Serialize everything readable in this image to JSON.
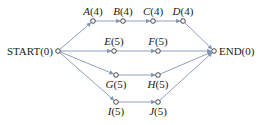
{
  "diagram": {
    "type": "project network (activity-on-node)",
    "nodes": [
      {
        "id": "START",
        "label": "START(0)",
        "letter": "START",
        "duration": "0",
        "x": 58,
        "y": 51
      },
      {
        "id": "A",
        "label": "A(4)",
        "letter": "A",
        "duration": "4",
        "x": 93,
        "y": 21
      },
      {
        "id": "B",
        "label": "B(4)",
        "letter": "B",
        "duration": "4",
        "x": 123,
        "y": 21
      },
      {
        "id": "C",
        "label": "C(4)",
        "letter": "C",
        "duration": "4",
        "x": 153,
        "y": 21
      },
      {
        "id": "D",
        "label": "D(4)",
        "letter": "D",
        "duration": "4",
        "x": 183,
        "y": 21
      },
      {
        "id": "E",
        "label": "E(5)",
        "letter": "E",
        "duration": "5",
        "x": 114,
        "y": 51
      },
      {
        "id": "F",
        "label": "F(5)",
        "letter": "F",
        "duration": "5",
        "x": 158,
        "y": 51
      },
      {
        "id": "G",
        "label": "G(5)",
        "letter": "G",
        "duration": "5",
        "x": 116,
        "y": 75
      },
      {
        "id": "H",
        "label": "H(5)",
        "letter": "H",
        "duration": "5",
        "x": 158,
        "y": 75
      },
      {
        "id": "I",
        "label": "I(5)",
        "letter": "I",
        "duration": "5",
        "x": 116,
        "y": 102
      },
      {
        "id": "J",
        "label": "J(5)",
        "letter": "J",
        "duration": "5",
        "x": 158,
        "y": 102
      },
      {
        "id": "END",
        "label": "END(0)",
        "letter": "END",
        "duration": "0",
        "x": 214,
        "y": 51
      }
    ],
    "edges": [
      [
        "START",
        "A"
      ],
      [
        "A",
        "B"
      ],
      [
        "B",
        "C"
      ],
      [
        "C",
        "D"
      ],
      [
        "D",
        "END"
      ],
      [
        "START",
        "E"
      ],
      [
        "E",
        "F"
      ],
      [
        "F",
        "END"
      ],
      [
        "START",
        "G"
      ],
      [
        "G",
        "H"
      ],
      [
        "H",
        "END"
      ],
      [
        "START",
        "I"
      ],
      [
        "I",
        "J"
      ],
      [
        "J",
        "END"
      ]
    ],
    "colors": {
      "edge": "#7f95b5",
      "node_stroke": "#333333",
      "text": "#222222"
    }
  }
}
